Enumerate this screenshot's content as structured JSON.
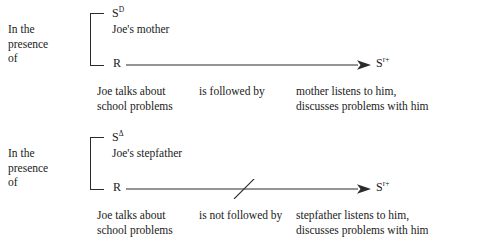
{
  "diagram": {
    "panels": [
      {
        "id": "panel-sd",
        "presence": {
          "line1": "In the",
          "line2": "presence",
          "line3": "of"
        },
        "stimulus": {
          "symbol": "S",
          "superscript": "D",
          "description": "Joe's mother"
        },
        "response": {
          "symbol": "R"
        },
        "consequence": {
          "symbol": "S",
          "superscript": "r+"
        },
        "arrow": {
          "crossed_out": false
        },
        "caption": {
          "antecedent_line1": "Joe talks about",
          "antecedent_line2": "school problems",
          "relation": "is followed by",
          "consequent_line1": "mother listens to him,",
          "consequent_line2": "discusses problems with him"
        }
      },
      {
        "id": "panel-sdelta",
        "presence": {
          "line1": "In the",
          "line2": "presence",
          "line3": "of"
        },
        "stimulus": {
          "symbol": "S",
          "superscript": "Δ",
          "description": "Joe's stepfather"
        },
        "response": {
          "symbol": "R"
        },
        "consequence": {
          "symbol": "S",
          "superscript": "r+"
        },
        "arrow": {
          "crossed_out": true
        },
        "caption": {
          "antecedent_line1": "Joe talks about",
          "antecedent_line2": "school problems",
          "relation": "is not followed by",
          "consequent_line1": "stepfather listens to him,",
          "consequent_line2": "discusses problems with him"
        }
      }
    ],
    "colors": {
      "background": "#ffffff",
      "ink": "#1a1a1a",
      "line": "#2b2b2b"
    }
  }
}
